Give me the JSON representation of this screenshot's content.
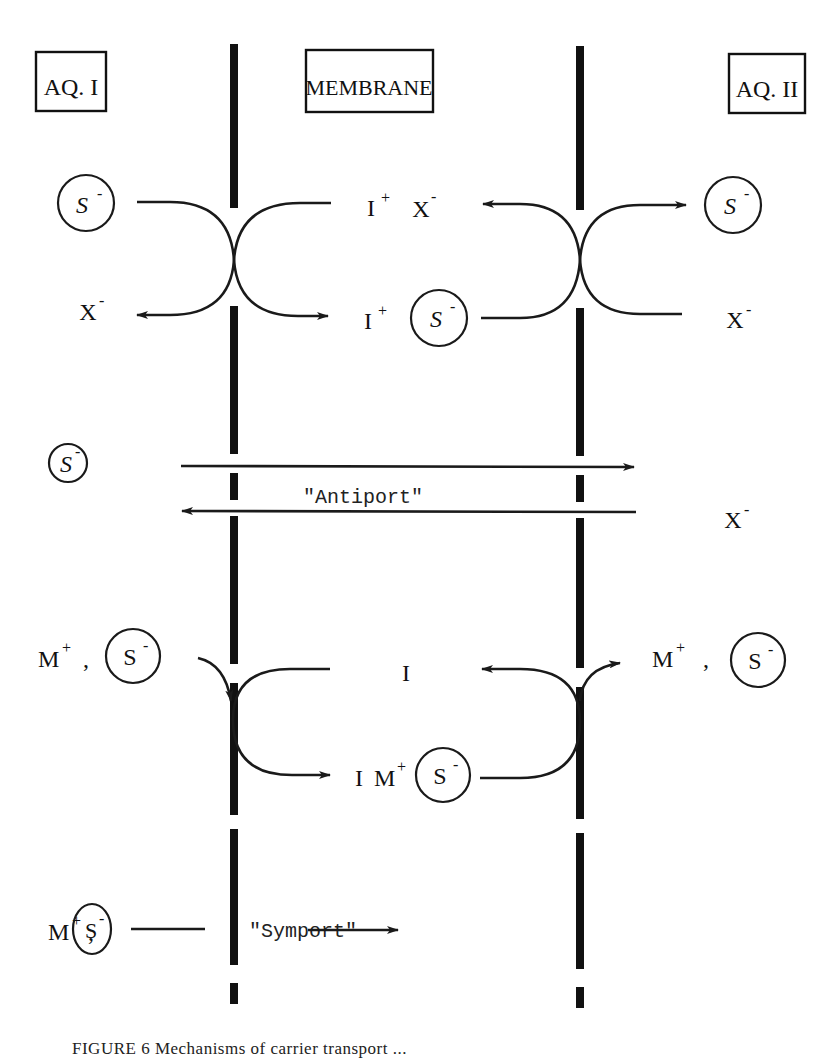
{
  "headers": {
    "aq1": "AQ. I",
    "membrane": "MEMBRANE",
    "aq2": "AQ. II"
  },
  "species": {
    "substrate_anion": "S",
    "substrate_charge": "-",
    "counter_anion": "X",
    "counter_charge": "-",
    "carrier": "I",
    "carrier_charge": "+",
    "metal_cation": "M",
    "metal_charge": "+",
    "comma": ","
  },
  "labels": {
    "antiport": "\"Antiport\"",
    "symport": "\"Symport\""
  },
  "caption": "FIGURE 6   Mechanisms of carrier transport ..."
}
